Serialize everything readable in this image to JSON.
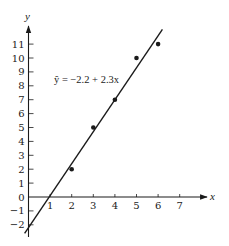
{
  "chart_data": {
    "type": "scatter",
    "title": "",
    "xlabel": "x",
    "ylabel": "y",
    "xlim": [
      0,
      7
    ],
    "ylim": [
      -2,
      11
    ],
    "x_ticks": [
      1,
      2,
      3,
      4,
      5,
      6,
      7
    ],
    "y_ticks": [
      -2,
      -1,
      0,
      1,
      2,
      3,
      4,
      5,
      6,
      7,
      8,
      9,
      10,
      11
    ],
    "grid": false,
    "legend": null,
    "series": [
      {
        "name": "observed",
        "type": "scatter",
        "points": [
          {
            "x": 2,
            "y": 2
          },
          {
            "x": 3,
            "y": 5
          },
          {
            "x": 4,
            "y": 7
          },
          {
            "x": 5,
            "y": 10
          },
          {
            "x": 6,
            "y": 11
          }
        ]
      },
      {
        "name": "regression line",
        "type": "line",
        "intercept": -2.2,
        "slope": 2.3,
        "x_range": [
          -0.18,
          6.2
        ]
      }
    ],
    "annotations": [
      {
        "text": "ŷ = −2.2 + 2.3x",
        "x": 1.15,
        "y": 8.2
      }
    ]
  },
  "labels": {
    "x_axis": "x",
    "y_axis": "y",
    "equation": "ŷ = −2.2 + 2.3x"
  },
  "colors": {
    "ink": "#1a1a1a",
    "background": "#ffffff"
  }
}
